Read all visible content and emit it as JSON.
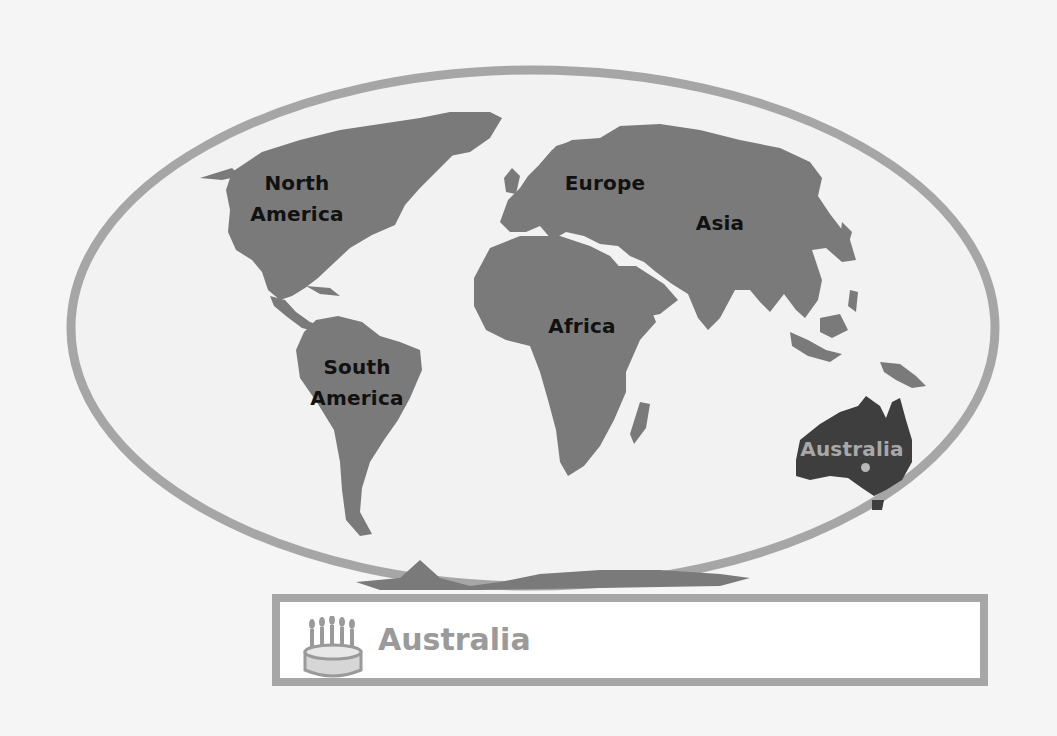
{
  "map": {
    "title": "World Map — Continents",
    "continents": [
      {
        "id": "north-america",
        "line1": "North",
        "line2": "America",
        "highlighted": false
      },
      {
        "id": "south-america",
        "line1": "South",
        "line2": "America",
        "highlighted": false
      },
      {
        "id": "europe",
        "label": "Europe",
        "highlighted": false
      },
      {
        "id": "asia",
        "label": "Asia",
        "highlighted": false
      },
      {
        "id": "africa",
        "label": "Africa",
        "highlighted": false
      },
      {
        "id": "australia",
        "label": "Australia",
        "highlighted": true
      }
    ]
  },
  "caption": {
    "icon": "birthday-cake-icon",
    "text": "Australia"
  },
  "colors": {
    "background": "#f5f5f5",
    "ocean": "#f2f2f2",
    "land": "#7a7a7a",
    "highlight_land": "#3e3e3e",
    "frame": "#a6a6a6",
    "label_text": "#111111",
    "highlight_text": "#a8a8a8"
  }
}
